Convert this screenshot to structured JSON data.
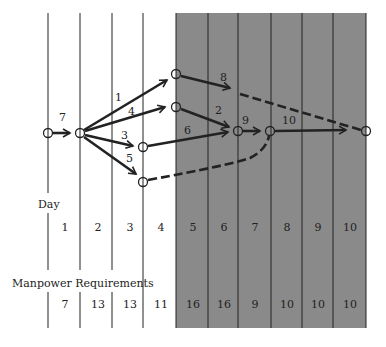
{
  "diagram": {
    "shaded_region": {
      "from_day": 5,
      "to_day": 10,
      "color": "#8a8a8a"
    },
    "day_heading": "Day",
    "manpower_heading": "Manpower Requirements",
    "days": [
      "1",
      "2",
      "3",
      "4",
      "5",
      "6",
      "7",
      "8",
      "9",
      "10"
    ],
    "manpower": [
      "7",
      "13",
      "13",
      "11",
      "16",
      "16",
      "9",
      "10",
      "10",
      "10"
    ],
    "activities": [
      {
        "label": "7",
        "style": "solid"
      },
      {
        "label": "1",
        "style": "solid"
      },
      {
        "label": "4",
        "style": "solid"
      },
      {
        "label": "3",
        "style": "solid"
      },
      {
        "label": "5",
        "style": "solid"
      },
      {
        "label": "8",
        "style": "solid-then-dashed"
      },
      {
        "label": "2",
        "style": "solid"
      },
      {
        "label": "6",
        "style": "solid"
      },
      {
        "label": "9",
        "style": "solid"
      },
      {
        "label": "10",
        "style": "solid"
      }
    ],
    "colors": {
      "line": "#222222",
      "shade": "#8a8a8a",
      "background": "#ffffff"
    }
  }
}
